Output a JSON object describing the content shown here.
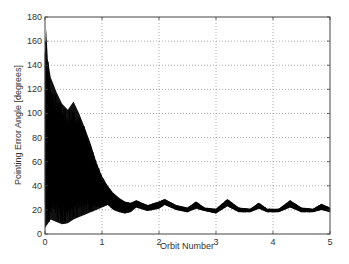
{
  "chart_data": {
    "type": "line",
    "title": "",
    "xlabel": "Orbit Number",
    "ylabel": "Pointing Error Angle  [degrees]",
    "xlim": [
      0,
      5
    ],
    "ylim": [
      0,
      180
    ],
    "xticks": [
      0,
      1,
      2,
      3,
      4,
      5
    ],
    "yticks": [
      0,
      20,
      40,
      60,
      80,
      100,
      120,
      140,
      160,
      180
    ],
    "grid": true,
    "legend": null,
    "series": [
      {
        "name": "Pointing Error Angle",
        "color": "#000000",
        "description": "Dense oscillation: large amplitude initially (peak ~170 deg at orbit ~0.02), decaying by orbit ~1.3, then settling into periodic humps between ~20 and ~28 deg",
        "upper_envelope": {
          "x": [
            0.0,
            0.02,
            0.05,
            0.1,
            0.2,
            0.3,
            0.4,
            0.5,
            0.6,
            0.7,
            0.8,
            0.9,
            1.0,
            1.1,
            1.2,
            1.3,
            1.4,
            1.5,
            1.6,
            1.8,
            2.0,
            2.1,
            2.3,
            2.5,
            2.65,
            2.8,
            3.0,
            3.2,
            3.4,
            3.6,
            3.75,
            3.9,
            4.1,
            4.3,
            4.5,
            4.7,
            4.85,
            5.0
          ],
          "y": [
            150,
            170,
            145,
            130,
            118,
            108,
            103,
            110,
            100,
            88,
            75,
            60,
            48,
            40,
            34,
            30,
            27,
            26,
            28,
            24,
            27,
            29,
            24,
            22,
            27,
            22,
            21,
            29,
            22,
            21,
            26,
            21,
            21,
            28,
            22,
            21,
            25,
            22
          ]
        },
        "lower_envelope": {
          "x": [
            0.0,
            0.1,
            0.2,
            0.3,
            0.4,
            0.5,
            0.6,
            0.7,
            0.8,
            0.9,
            1.0,
            1.1,
            1.2,
            1.3,
            1.4,
            1.5,
            1.6,
            1.8,
            2.0,
            2.1,
            2.3,
            2.5,
            2.65,
            2.8,
            3.0,
            3.2,
            3.4,
            3.6,
            3.75,
            3.9,
            4.1,
            4.3,
            4.5,
            4.7,
            4.85,
            5.0
          ],
          "y": [
            5,
            12,
            10,
            8,
            9,
            12,
            14,
            16,
            18,
            20,
            22,
            24,
            20,
            18,
            17,
            18,
            22,
            19,
            21,
            24,
            20,
            18,
            21,
            19,
            17,
            23,
            18,
            18,
            21,
            18,
            18,
            22,
            18,
            18,
            20,
            18
          ]
        }
      }
    ]
  }
}
